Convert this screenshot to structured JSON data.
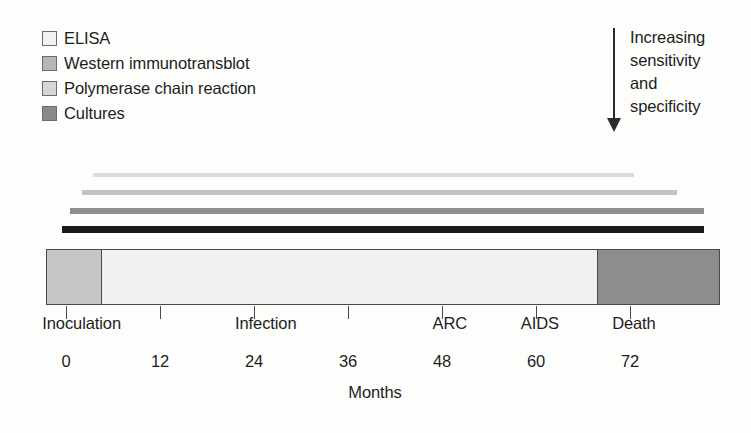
{
  "figure": {
    "axis_title": "Months"
  },
  "legend": {
    "items": [
      {
        "label": "ELISA",
        "color": "#f2f2f0",
        "border": "#6b6b6b"
      },
      {
        "label": "Western immunotransblot",
        "color": "#b6b6b4",
        "border": "#6b6b6b"
      },
      {
        "label": "Polymerase chain reaction",
        "color": "#d6d6d4",
        "border": "#6b6b6b"
      },
      {
        "label": "Cultures",
        "color": "#8a8a88",
        "border": "#6b6b6b"
      }
    ]
  },
  "annotation": {
    "arrow_icon": "down-arrow-icon",
    "lines": [
      "Increasing",
      "sensitivity",
      "and",
      "specificity"
    ],
    "text": "Increasing sensitivity and specificity",
    "direction": "down"
  },
  "chart_data": {
    "type": "bar",
    "xlabel": "Months",
    "ylabel": "",
    "xlim": [
      0,
      72
    ],
    "grid": false,
    "legend_position": "top-left",
    "categories": [
      "ELISA",
      "Western immunotransblot",
      "Polymerase chain reaction",
      "Cultures"
    ],
    "series": [
      {
        "name": "ELISA",
        "start_month": 3.5,
        "end_month": 72.5,
        "color": "#dcdcda",
        "thickness_px": 4
      },
      {
        "name": "Western immunotransblot",
        "start_month": 2.0,
        "end_month": 78.0,
        "color": "#c2c2c0",
        "thickness_px": 5
      },
      {
        "name": "Polymerase chain reaction",
        "start_month": 0.5,
        "end_month": 81.5,
        "color": "#8e8e8c",
        "thickness_px": 6
      },
      {
        "name": "Cultures",
        "start_month": -0.5,
        "end_month": 81.5,
        "color": "#1a1a1a",
        "thickness_px": 7
      }
    ],
    "timeline_segments": [
      {
        "name": "Inoculation phase",
        "start_month": -2.5,
        "end_month": 4.5,
        "color": "#c6c6c4"
      },
      {
        "name": "Infection phase",
        "start_month": 4.5,
        "end_month": 68.0,
        "color": "#f1f1ef"
      },
      {
        "name": "Death phase",
        "start_month": 68.0,
        "end_month": 83.5,
        "color": "#8d8d8b"
      }
    ],
    "tick_values": [
      0,
      12,
      24,
      36,
      48,
      60,
      72
    ],
    "tick_labels": [
      "0",
      "12",
      "24",
      "36",
      "48",
      "60",
      "72"
    ],
    "stage_labels": [
      {
        "label": "Inoculation",
        "month": 2
      },
      {
        "label": "Infection",
        "month": 25.5
      },
      {
        "label": "ARC",
        "month": 49
      },
      {
        "label": "AIDS",
        "month": 60.5
      },
      {
        "label": "Death",
        "month": 72.5
      }
    ]
  }
}
